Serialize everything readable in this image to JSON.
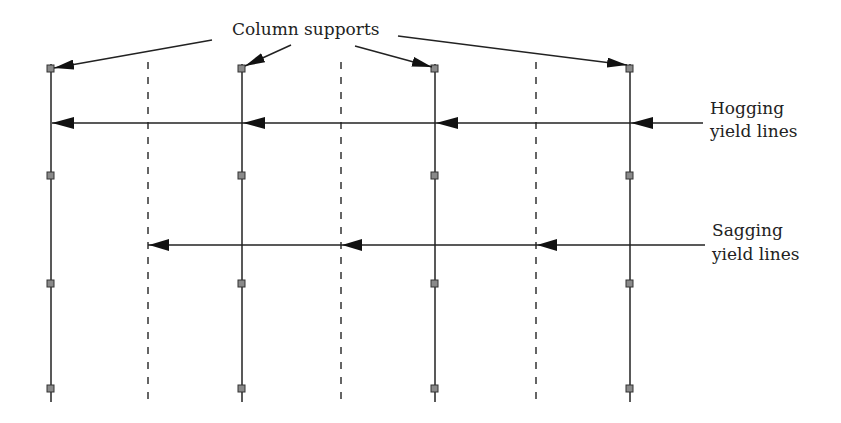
{
  "labels": {
    "column_supports": "Column supports",
    "hogging_line1": "Hogging",
    "hogging_line2": "yield lines",
    "sagging_line1": "Sagging",
    "sagging_line2": "yield lines"
  },
  "diagram": {
    "column_lines_x": [
      51,
      242,
      435,
      630
    ],
    "support_rows_y": [
      68,
      175,
      284,
      389
    ],
    "sagging_dashed_x": [
      148,
      341,
      536
    ],
    "hogging_yield_line_y": 123,
    "sagging_yield_line_y": 245,
    "colors": {
      "line": "#222222",
      "support_fill": "#8a8a8a"
    }
  }
}
